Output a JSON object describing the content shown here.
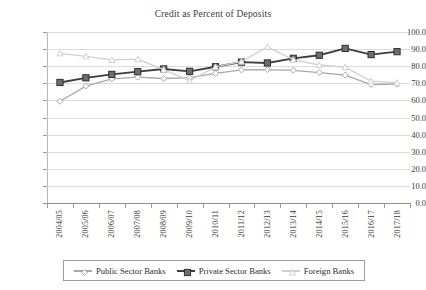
{
  "chart_data": {
    "type": "line",
    "title": "Credit as Percent of Deposits",
    "xlabel": "",
    "ylabel": "",
    "ylim": [
      0.0,
      100.0
    ],
    "yticks": [
      "0.0",
      "10.0",
      "20.0",
      "30.0",
      "40.0",
      "50.0",
      "60.0",
      "70.0",
      "80.0",
      "90.0",
      "100.0"
    ],
    "grid": true,
    "legend_position": "bottom",
    "categories": [
      "2004/05",
      "2005/06",
      "2006/07",
      "2007/08",
      "2008/09",
      "2009/10",
      "2010/11",
      "2011/12",
      "2012/13",
      "2013/14",
      "2014/15",
      "2015/16",
      "2016/17",
      "2017/18"
    ],
    "series": [
      {
        "name": "Public Sector Banks",
        "marker": "diamond",
        "color": "#a8a8a8",
        "values": [
          59.5,
          68.3,
          72.6,
          73.6,
          72.8,
          73.3,
          75.8,
          77.8,
          78.0,
          77.6,
          76.3,
          74.8,
          69.3,
          69.5
        ]
      },
      {
        "name": "Private Sector Banks",
        "marker": "square",
        "color": "#3d3d3d",
        "values": [
          70.5,
          73.2,
          75.2,
          76.8,
          78.4,
          77.0,
          79.7,
          82.4,
          81.9,
          84.6,
          86.4,
          90.4,
          86.8,
          88.5
        ]
      },
      {
        "name": "Foreign Banks",
        "marker": "triangle",
        "color": "#cfcfcf",
        "values": [
          87.5,
          85.8,
          83.7,
          84.1,
          78.0,
          71.5,
          79.6,
          82.7,
          91.3,
          83.8,
          80.7,
          79.4,
          71.3,
          70.4
        ]
      }
    ]
  }
}
